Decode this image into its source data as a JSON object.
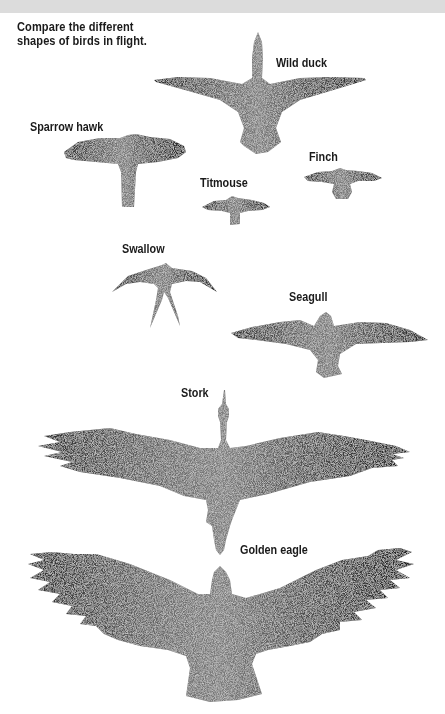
{
  "caption": {
    "line1": "Compare the different",
    "line2": "shapes of birds in flight."
  },
  "birds": [
    {
      "name": "Wild duck",
      "icon": "wild-duck-silhouette"
    },
    {
      "name": "Sparrow hawk",
      "icon": "sparrow-hawk-silhouette"
    },
    {
      "name": "Finch",
      "icon": "finch-silhouette"
    },
    {
      "name": "Titmouse",
      "icon": "titmouse-silhouette"
    },
    {
      "name": "Swallow",
      "icon": "swallow-silhouette"
    },
    {
      "name": "Seagull",
      "icon": "seagull-silhouette"
    },
    {
      "name": "Stork",
      "icon": "stork-silhouette"
    },
    {
      "name": "Golden eagle",
      "icon": "golden-eagle-silhouette"
    }
  ],
  "colors": {
    "background": "#ffffff",
    "top_band": "#dcdcdc",
    "ink": "#1a1a1a",
    "stipple_dark": "#2a2a2a",
    "stipple_light": "#9a9a9a"
  }
}
